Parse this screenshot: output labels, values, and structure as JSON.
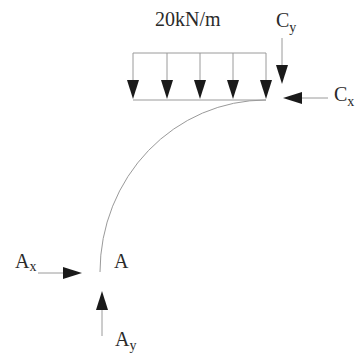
{
  "diagram": {
    "load_label": "20kN/m",
    "point_label": "A",
    "reactions": {
      "cy_main": "C",
      "cy_sub": "y",
      "cx_main": "C",
      "cx_sub": "x",
      "ax_main": "A",
      "ax_sub": "x",
      "ay_main": "A",
      "ay_sub": "y"
    },
    "colors": {
      "line": "#9a9a9a",
      "arrow": "#1a1a1a",
      "text": "#2a2a2a"
    }
  }
}
